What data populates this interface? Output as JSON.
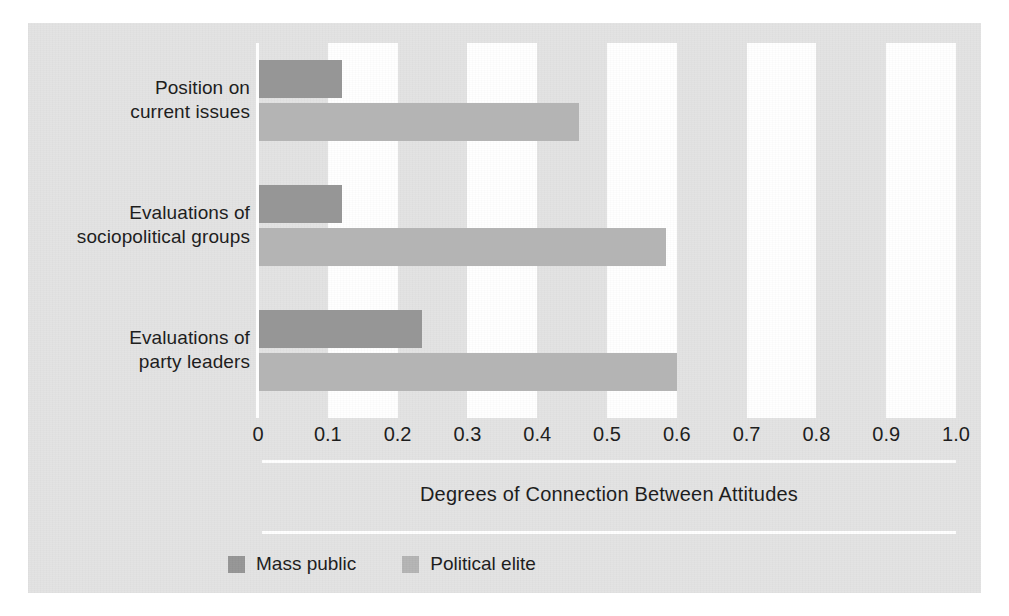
{
  "chart_data": {
    "type": "bar",
    "orientation": "horizontal",
    "title": "",
    "xlabel": "Degrees of Connection Between Attitudes",
    "ylabel": "",
    "xlim": [
      0,
      1.0
    ],
    "grid": "alternating vertical white bands every 0.1",
    "legend_position": "bottom-left",
    "categories": [
      "Position on\ncurrent issues",
      "Evaluations of\nsociopolitical groups",
      "Evaluations of\nparty leaders"
    ],
    "category_lines": [
      [
        "Position on",
        "current issues"
      ],
      [
        "Evaluations of",
        "sociopolitical groups"
      ],
      [
        "Evaluations of",
        "party leaders"
      ]
    ],
    "series": [
      {
        "name": "Mass public",
        "color": "#969696",
        "values": [
          0.12,
          0.12,
          0.235
        ]
      },
      {
        "name": "Political elite",
        "color": "#b4b4b4",
        "values": [
          0.46,
          0.585,
          0.6
        ]
      }
    ],
    "xticks": [
      0,
      0.1,
      0.2,
      0.3,
      0.4,
      0.5,
      0.6,
      0.7,
      0.8,
      0.9,
      1.0
    ],
    "xtick_labels": [
      "0",
      "0.1",
      "0.2",
      "0.3",
      "0.4",
      "0.5",
      "0.6",
      "0.7",
      "0.8",
      "0.9",
      "1.0"
    ]
  },
  "figure": {
    "background_color": "#e3e3e3",
    "band_color": "#ffffff",
    "axis_line_color": "#fdfdfd",
    "text_color": "#1b1b1b"
  },
  "axis_title": "Degrees of Connection Between Attitudes",
  "legend": {
    "items": [
      {
        "label": "Mass public",
        "color": "#969696"
      },
      {
        "label": "Political elite",
        "color": "#b4b4b4"
      }
    ]
  }
}
